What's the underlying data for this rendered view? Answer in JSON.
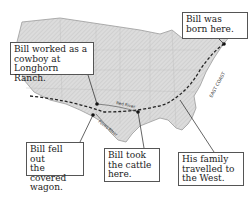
{
  "callouts": {
    "born": "Bill was\nborn here.",
    "cowboy": "Bill worked as a\ncowboy at\nLonghorn Ranch.",
    "wagon": "Bill fell out\nthe covered\nwagon.",
    "cattle": "Bill took\nthe cattle\nhere.",
    "family": "His family\ntravelled to\nthe West."
  },
  "map_labels": {
    "east_coast": "EAST COAST",
    "red_river": "Red River",
    "pecos_river": "Pecos River"
  },
  "colors": {
    "land": "#d8d8d8",
    "land_shade": "#bdbdbd",
    "route": "#222222",
    "border": "#555555"
  }
}
